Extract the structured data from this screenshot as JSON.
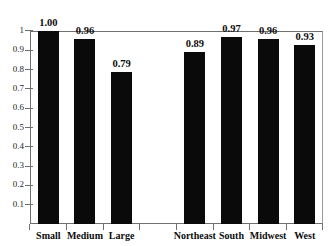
{
  "chart_data": {
    "type": "bar",
    "title": "",
    "subtitle": "",
    "xlabel": "",
    "ylabel": "",
    "ylim": [
      0,
      1
    ],
    "grid": false,
    "legend": null,
    "orientation": "vertical",
    "bar_color": "#0a0a0a",
    "axis_color": "#6f6f6f",
    "background": "#ffffff",
    "ytick_labels": [
      "1",
      "0.9",
      "0.8",
      "0.7",
      "0.6",
      "0.5",
      "0.4",
      "0.3",
      "0.2",
      "0.1"
    ],
    "ytick_values": [
      1,
      0.9,
      0.8,
      0.7,
      0.6,
      0.5,
      0.4,
      0.3,
      0.2,
      0.1
    ],
    "categories": [
      "Small",
      "Medium",
      "Large",
      "Northeast",
      "South",
      "Midwest",
      "West"
    ],
    "values": [
      1.0,
      0.96,
      0.79,
      0.89,
      0.97,
      0.96,
      0.93
    ],
    "value_labels": [
      "1.00",
      "0.96",
      "0.79",
      "0.89",
      "0.97",
      "0.96",
      "0.93"
    ],
    "groups": [
      {
        "name": "Size",
        "categories": [
          "Small",
          "Medium",
          "Large"
        ]
      },
      {
        "name": "Region",
        "categories": [
          "Northeast",
          "South",
          "Midwest",
          "West"
        ]
      }
    ],
    "slot_count": 8,
    "empty_slot_index": 3,
    "bars": [
      {
        "label": "Small",
        "value": 1.0,
        "value_label": "1.00",
        "slot": 0
      },
      {
        "label": "Medium",
        "value": 0.96,
        "value_label": "0.96",
        "slot": 1
      },
      {
        "label": "Large",
        "value": 0.79,
        "value_label": "0.79",
        "slot": 2
      },
      {
        "label": "Northeast",
        "value": 0.89,
        "value_label": "0.89",
        "slot": 4
      },
      {
        "label": "South",
        "value": 0.97,
        "value_label": "0.97",
        "slot": 5
      },
      {
        "label": "Midwest",
        "value": 0.96,
        "value_label": "0.96",
        "slot": 6
      },
      {
        "label": "West",
        "value": 0.93,
        "value_label": "0.93",
        "slot": 7
      }
    ]
  }
}
